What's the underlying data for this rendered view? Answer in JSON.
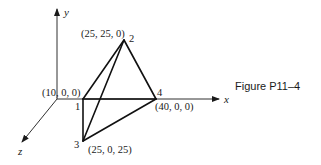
{
  "figure": {
    "caption": "Figure P11–4"
  },
  "axes": {
    "x_label": "x",
    "y_label": "y",
    "z_label": "z"
  },
  "nodes": [
    {
      "id": "1",
      "coord_label": "(10, 0, 0)"
    },
    {
      "id": "2",
      "coord_label": "(25, 25, 0)"
    },
    {
      "id": "3",
      "coord_label": "(25, 0, 25)"
    },
    {
      "id": "4",
      "coord_label": "(40, 0, 0)"
    }
  ],
  "elements": [
    {
      "from": "1",
      "to": "2"
    },
    {
      "from": "1",
      "to": "4"
    },
    {
      "from": "1",
      "to": "3"
    },
    {
      "from": "2",
      "to": "3"
    },
    {
      "from": "2",
      "to": "4"
    },
    {
      "from": "3",
      "to": "4"
    }
  ],
  "colors": {
    "line": "#111111",
    "background": "#ffffff"
  }
}
